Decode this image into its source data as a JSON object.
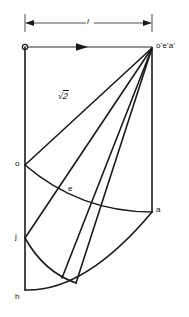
{
  "figure": {
    "type": "engineering-projection-diagram",
    "background_color": "#ffffff",
    "line_color": "#1a1a1a",
    "width": 189,
    "height": 317
  },
  "dimension": {
    "label": "l",
    "from_x": 25,
    "to_x": 152,
    "y": 23,
    "style": "double-arrow"
  },
  "radius_label": {
    "text": "√2",
    "radical": "√",
    "radicand": "2",
    "x": 60,
    "y": 97
  },
  "points": [
    {
      "id": "apex",
      "label": "o'e'a'",
      "x": 152,
      "y": 48,
      "label_x": 156,
      "label_y": 43
    },
    {
      "id": "origin",
      "label": "",
      "x": 25,
      "y": 47,
      "label_x": 0,
      "label_y": 0
    },
    {
      "id": "o",
      "label": "o",
      "x": 25,
      "y": 165,
      "label_x": 15,
      "label_y": 161
    },
    {
      "id": "e",
      "label": "e",
      "x": 66,
      "y": 192,
      "label_x": 68,
      "label_y": 186
    },
    {
      "id": "a",
      "label": "a",
      "x": 152,
      "y": 212,
      "label_x": 156,
      "label_y": 207
    },
    {
      "id": "j",
      "label": "j",
      "x": 25,
      "y": 238,
      "label_x": 15,
      "label_y": 234
    },
    {
      "id": "h",
      "label": "h",
      "x": 25,
      "y": 290,
      "label_x": 15,
      "label_y": 294
    },
    {
      "id": "k",
      "label": "",
      "x": 76,
      "y": 283,
      "label_x": 0,
      "label_y": 0
    }
  ],
  "elements": {
    "axis_horizontal": "o to o'e'a' with direction arrow at midpoint",
    "axis_vertical_left": "origin down to h",
    "axis_vertical_right": "apex down to a",
    "radial_lines_count": 4,
    "arcs": [
      "arc o-e-a",
      "arc j through lower region",
      "arc h to k (bottom)"
    ]
  },
  "arrow": {
    "direction": "right",
    "x": 82,
    "y": 47
  }
}
